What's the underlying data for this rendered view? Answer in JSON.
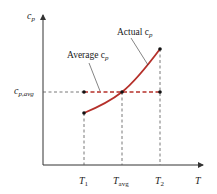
{
  "diagram": {
    "axes": {
      "y_label": "c",
      "y_label_sub": "p",
      "x_label": "T"
    },
    "x_ticks": [
      {
        "main": "T",
        "sub": "1"
      },
      {
        "main": "T",
        "sub": "avg"
      },
      {
        "main": "T",
        "sub": "2"
      }
    ],
    "y_ticks": [
      {
        "main": "c",
        "sub": "p,avg"
      }
    ],
    "annotations": {
      "actual": {
        "text": "Actual c",
        "sub": "p"
      },
      "average": {
        "text": "Average c",
        "sub": "p"
      }
    },
    "colors": {
      "curve": "#b5302a",
      "average_line": "#b5302a",
      "axis": "#333333",
      "guide": "#555555"
    }
  }
}
